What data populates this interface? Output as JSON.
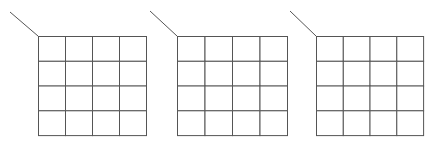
{
  "diagram": {
    "line_color": "#555555",
    "grids": [
      {
        "x": 38,
        "y": 36,
        "width": 108,
        "height": 99,
        "rows": 4,
        "cols": 4,
        "leader": {
          "x1": 10,
          "y1": 12,
          "x2": 38,
          "y2": 36
        }
      },
      {
        "x": 177,
        "y": 36,
        "width": 110,
        "height": 99,
        "rows": 4,
        "cols": 4,
        "leader": {
          "x1": 150,
          "y1": 11,
          "x2": 177,
          "y2": 36
        }
      },
      {
        "x": 316,
        "y": 36,
        "width": 107,
        "height": 99,
        "rows": 4,
        "cols": 4,
        "leader": {
          "x1": 290,
          "y1": 11,
          "x2": 316,
          "y2": 36
        }
      }
    ]
  }
}
